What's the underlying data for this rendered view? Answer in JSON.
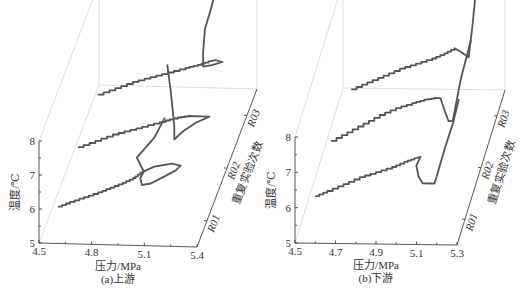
{
  "chart_data": [
    {
      "id": "a",
      "type": "line",
      "subtype": "3d-waterfall",
      "caption": "(a)上游",
      "xlabel": "压力/MPa",
      "ylabel": "温度/℃",
      "zlabel": "重复实验次数",
      "x_ticks": [
        "4.5",
        "4.8",
        "5.1",
        "5.4"
      ],
      "xlim": [
        4.5,
        5.4
      ],
      "y_ticks": [
        "5",
        "6",
        "7",
        "8"
      ],
      "ylim": [
        5,
        8
      ],
      "z_ticks": [
        "R01",
        "R02",
        "R03"
      ],
      "series": [
        {
          "name": "R01",
          "x": [
            4.55,
            4.62,
            4.7,
            4.78,
            4.85,
            4.92,
            4.98,
            5.02,
            5.06,
            5.1,
            5.15,
            5.2,
            5.25,
            5.22,
            5.15,
            5.08,
            5.03,
            5.02,
            5.04,
            5.0,
            5.1,
            5.16
          ],
          "y": [
            5.3,
            5.45,
            5.6,
            5.75,
            5.9,
            6.05,
            6.2,
            6.35,
            6.45,
            6.55,
            6.6,
            6.65,
            6.6,
            6.45,
            6.25,
            6.05,
            6.0,
            6.2,
            6.4,
            6.8,
            7.4,
            8.0
          ]
        },
        {
          "name": "R02",
          "x": [
            4.55,
            4.65,
            4.75,
            4.85,
            4.95,
            5.05,
            5.12,
            5.18,
            5.25,
            5.3,
            5.22,
            5.15,
            5.1,
            5.1,
            5.08,
            5.06
          ],
          "y": [
            5.5,
            5.7,
            5.9,
            6.05,
            6.2,
            6.35,
            6.45,
            6.5,
            6.5,
            6.5,
            6.3,
            6.05,
            5.8,
            6.2,
            7.2,
            8.0
          ]
        },
        {
          "name": "R03",
          "x": [
            4.55,
            4.65,
            4.75,
            4.85,
            4.95,
            5.05,
            5.12,
            5.18,
            5.22,
            5.26,
            5.2,
            5.15,
            5.15,
            5.16,
            5.2,
            5.24
          ],
          "y": [
            5.5,
            5.7,
            5.9,
            6.05,
            6.2,
            6.35,
            6.45,
            6.55,
            6.6,
            6.55,
            6.45,
            6.4,
            6.8,
            7.5,
            8.2,
            9.0
          ]
        }
      ]
    },
    {
      "id": "b",
      "type": "line",
      "subtype": "3d-waterfall",
      "caption": "(b)下游",
      "xlabel": "压力/MPa",
      "ylabel": "温度/℃",
      "zlabel": "重复实验次数",
      "x_ticks": [
        "4.5",
        "4.7",
        "4.9",
        "5.1",
        "5.3"
      ],
      "xlim": [
        4.5,
        5.3
      ],
      "y_ticks": [
        "5",
        "6",
        "7",
        "8"
      ],
      "ylim": [
        5,
        8
      ],
      "z_ticks": [
        "R01",
        "R02",
        "R03"
      ],
      "series": [
        {
          "name": "R01",
          "x": [
            4.56,
            4.62,
            4.7,
            4.78,
            4.86,
            4.94,
            5.0,
            5.05,
            5.08,
            5.06,
            5.07,
            5.09,
            5.15,
            5.17,
            5.2,
            5.24,
            5.27
          ],
          "y": [
            5.6,
            5.75,
            5.95,
            6.15,
            6.3,
            6.45,
            6.6,
            6.7,
            6.75,
            6.5,
            6.2,
            6.0,
            6.0,
            6.4,
            7.0,
            7.7,
            8.4
          ]
        },
        {
          "name": "R02",
          "x": [
            4.56,
            4.64,
            4.72,
            4.8,
            4.88,
            4.96,
            5.02,
            5.07,
            5.1,
            5.12,
            5.14,
            5.16,
            5.2,
            5.25
          ],
          "y": [
            5.7,
            5.95,
            6.2,
            6.45,
            6.65,
            6.8,
            6.9,
            6.95,
            6.95,
            6.6,
            6.3,
            6.3,
            7.5,
            8.6
          ]
        },
        {
          "name": "R03",
          "x": [
            4.58,
            4.66,
            4.74,
            4.82,
            4.9,
            4.98,
            5.04,
            5.09,
            5.12,
            5.16,
            5.18,
            5.2
          ],
          "y": [
            5.7,
            5.9,
            6.1,
            6.3,
            6.45,
            6.6,
            6.75,
            6.9,
            6.8,
            6.65,
            7.6,
            8.8
          ]
        }
      ]
    }
  ]
}
